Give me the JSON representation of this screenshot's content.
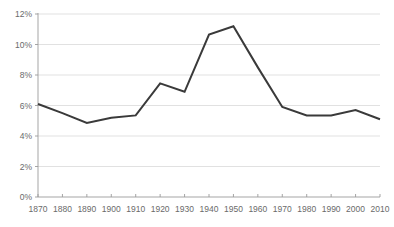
{
  "chart_data": {
    "type": "line",
    "title": "",
    "subtitle": "",
    "xlabel": "",
    "ylabel": "",
    "categories": [
      1870,
      1880,
      1890,
      1900,
      1910,
      1920,
      1930,
      1940,
      1950,
      1960,
      1970,
      1980,
      1990,
      2000,
      2010
    ],
    "x_tick_labels": [
      "1870",
      "1880",
      "1890",
      "1900",
      "1910",
      "1920",
      "1930",
      "1940",
      "1950",
      "1960",
      "1970",
      "1980",
      "1990",
      "2000",
      "2010"
    ],
    "y_tick_labels": [
      "0%",
      "2%",
      "4%",
      "6%",
      "8%",
      "10%",
      "12%"
    ],
    "y_tick_values": [
      0,
      2,
      4,
      6,
      8,
      10,
      12
    ],
    "ylim": [
      0,
      12
    ],
    "xlim": [
      1870,
      2010
    ],
    "grid": "horizontal",
    "legend": "none",
    "series": [
      {
        "name": "",
        "color": "#3a3a3a",
        "values": [
          6.1,
          5.5,
          4.85,
          5.2,
          5.35,
          7.45,
          6.9,
          10.65,
          11.2,
          8.5,
          5.9,
          5.35,
          5.35,
          5.7,
          5.1
        ]
      }
    ]
  }
}
